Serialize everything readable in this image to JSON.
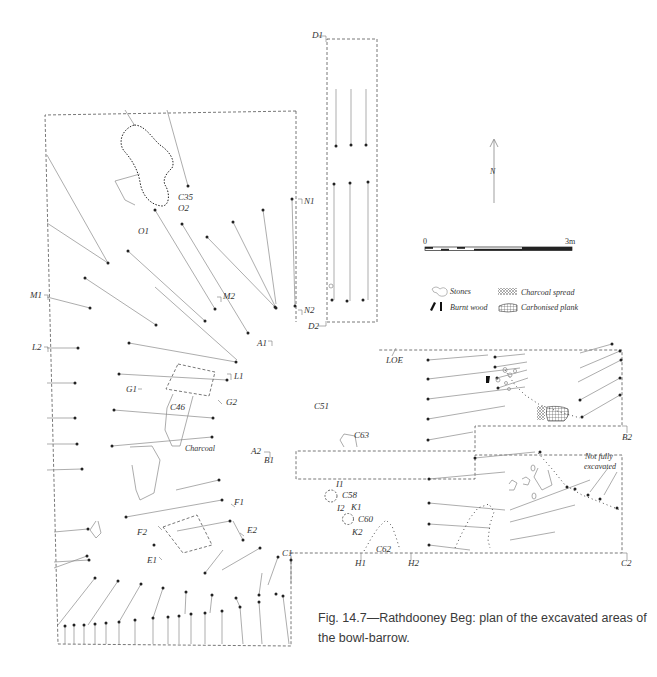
{
  "figure": {
    "caption": "Fig. 14.7—Rathdooney Beg: plan of the excavated areas of the bowl-barrow.",
    "north_label": "N",
    "scale_bar": {
      "start": "0",
      "end": "3m"
    },
    "legend": [
      {
        "symbol": "stones-icon",
        "label": "Stones"
      },
      {
        "symbol": "burnt-wood-icon",
        "label": "Burnt wood"
      },
      {
        "symbol": "charcoal-spread-icon",
        "label": "Charcoal spread"
      },
      {
        "symbol": "carbonised-plank-icon",
        "label": "Carbonised plank"
      }
    ],
    "annotations": {
      "not_fully_excavated": [
        "Not fully",
        "excavated"
      ],
      "charcoal": "Charcoal"
    },
    "section_labels": [
      {
        "id": "D1",
        "x": 312,
        "y": 36
      },
      {
        "id": "D2",
        "x": 310,
        "y": 326
      },
      {
        "id": "N1",
        "x": 304,
        "y": 202
      },
      {
        "id": "N2",
        "x": 304,
        "y": 313
      },
      {
        "id": "M1",
        "x": 32,
        "y": 295
      },
      {
        "id": "M2",
        "x": 223,
        "y": 296
      },
      {
        "id": "L2",
        "x": 32,
        "y": 347
      },
      {
        "id": "L1",
        "x": 236,
        "y": 379
      },
      {
        "id": "A1",
        "x": 258,
        "y": 345
      },
      {
        "id": "G1",
        "x": 127,
        "y": 392
      },
      {
        "id": "G2",
        "x": 227,
        "y": 404
      },
      {
        "id": "C35",
        "x": 178,
        "y": 199
      },
      {
        "id": "O2",
        "x": 178,
        "y": 210
      },
      {
        "id": "O1",
        "x": 138,
        "y": 234
      },
      {
        "id": "C46",
        "x": 172,
        "y": 410
      },
      {
        "id": "C51",
        "x": 315,
        "y": 409
      },
      {
        "id": "LOE",
        "x": 387,
        "y": 362
      },
      {
        "id": "A2",
        "x": 253,
        "y": 453
      },
      {
        "id": "B1",
        "x": 265,
        "y": 462
      },
      {
        "id": "C63",
        "x": 356,
        "y": 437
      },
      {
        "id": "B2",
        "x": 622,
        "y": 438
      },
      {
        "id": "I1",
        "x": 336,
        "y": 489
      },
      {
        "id": "C58",
        "x": 343,
        "y": 498
      },
      {
        "id": "I2",
        "x": 337,
        "y": 514
      },
      {
        "id": "K1",
        "x": 351,
        "y": 510
      },
      {
        "id": "C60",
        "x": 358,
        "y": 521
      },
      {
        "id": "K2",
        "x": 352,
        "y": 534
      },
      {
        "id": "F1",
        "x": 234,
        "y": 503
      },
      {
        "id": "F2",
        "x": 139,
        "y": 533
      },
      {
        "id": "E2",
        "x": 247,
        "y": 531
      },
      {
        "id": "E1",
        "x": 148,
        "y": 560
      },
      {
        "id": "C1",
        "x": 283,
        "y": 553
      },
      {
        "id": "C62",
        "x": 375,
        "y": 551
      },
      {
        "id": "H1",
        "x": 356,
        "y": 566
      },
      {
        "id": "H2",
        "x": 409,
        "y": 566
      },
      {
        "id": "C2",
        "x": 623,
        "y": 566
      }
    ]
  }
}
